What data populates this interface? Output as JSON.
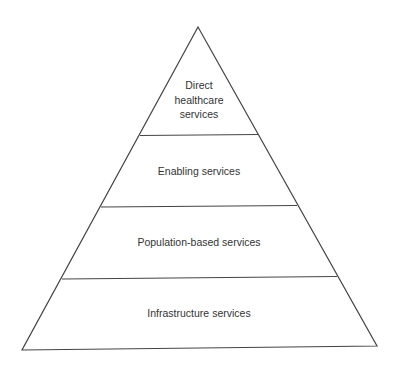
{
  "diagram": {
    "type": "pyramid",
    "colors": {
      "line": "#444444",
      "text": "#333333",
      "background": "#ffffff"
    },
    "levels": [
      {
        "lines": [
          "Direct",
          "healthcare",
          "services"
        ]
      },
      {
        "lines": [
          "Enabling services"
        ]
      },
      {
        "lines": [
          "Population-based services"
        ]
      },
      {
        "lines": [
          "Infrastructure services"
        ]
      }
    ]
  }
}
